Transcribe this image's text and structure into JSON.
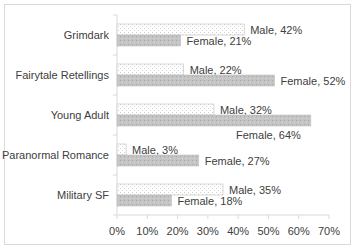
{
  "chart_data": {
    "type": "bar",
    "orientation": "horizontal",
    "title": "",
    "xlabel": "",
    "ylabel": "",
    "categories": [
      "Grimdark",
      "Fairytale Retellings",
      "Young Adult",
      "Paranormal Romance",
      "Military SF"
    ],
    "series": [
      {
        "name": "Male",
        "values": [
          42,
          22,
          32,
          3,
          35
        ],
        "color": "#f2f2f2",
        "pattern": "dotted"
      },
      {
        "name": "Female",
        "values": [
          21,
          52,
          64,
          27,
          18
        ],
        "color": "#bfbfbf",
        "pattern": "dotted"
      }
    ],
    "data_labels": {
      "Male": [
        "Male, 42%",
        "Male, 22%",
        "Male, 32%",
        "Male, 3%",
        "Male, 35%"
      ],
      "Female": [
        "Female, 21%",
        "Female, 52%",
        "Female, 64%",
        "Female, 27%",
        "Female, 18%"
      ]
    },
    "xlim": [
      0,
      70
    ],
    "x_ticks": [
      "0%",
      "10%",
      "20%",
      "30%",
      "40%",
      "50%",
      "60%",
      "70%"
    ],
    "grid": false,
    "legend": "none"
  }
}
